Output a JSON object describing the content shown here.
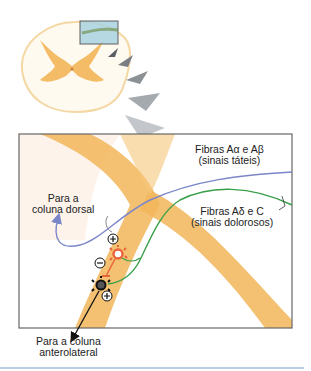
{
  "diagram": {
    "labels": {
      "fibers_ab_line1": "Fibras Aα e Aβ",
      "fibers_ab_line2": "(sinais táteis)",
      "fibers_ad_line1": "Fibras Aδ e C",
      "fibers_ad_line2": "(sinais dolorosos)",
      "dorsal_line1": "Para a",
      "dorsal_line2": "coluna dorsal",
      "anterolateral_line1": "Para a coluna",
      "anterolateral_line2": "anterolateral"
    },
    "synapse_signs": [
      "+",
      "−",
      "+"
    ],
    "colors": {
      "gray_matter": "#f5c46a",
      "tactile_fiber": "#7a86c8",
      "pain_fiber": "#3aa04a",
      "inhibitory_interneuron": "#e8643a",
      "projection_neuron": "#333333",
      "highlight_box": "#a9d3e0",
      "arrowheads": "#8c9196",
      "frame": "#666666",
      "divider": "#7a9cc8"
    }
  }
}
